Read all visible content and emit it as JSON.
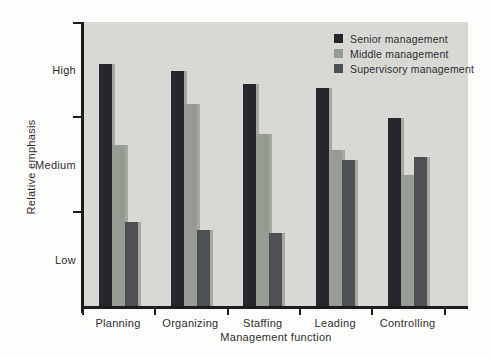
{
  "chart_data": {
    "type": "bar",
    "title": "",
    "xlabel": "Management function",
    "ylabel": "Relative emphasis",
    "categories": [
      "Planning",
      "Organizing",
      "Staffing",
      "Leading",
      "Controlling"
    ],
    "series": [
      {
        "name": "Senior management",
        "color": "#26262c",
        "values": [
          2.56,
          2.48,
          2.35,
          2.31,
          1.99
        ]
      },
      {
        "name": "Middle management",
        "color": "#979c92",
        "values": [
          1.71,
          2.14,
          1.82,
          1.65,
          1.39
        ]
      },
      {
        "name": "Supervisory management",
        "color": "#4e5054",
        "values": [
          0.89,
          0.81,
          0.78,
          1.55,
          1.58
        ]
      }
    ],
    "y_axis": {
      "min": 0,
      "max": 3,
      "tick_values": [
        1,
        2,
        3
      ],
      "band_labels": [
        {
          "label": "High",
          "value": 2.5
        },
        {
          "label": "Medium",
          "value": 1.5
        },
        {
          "label": "Low",
          "value": 0.5
        }
      ]
    },
    "legend_position": "top-right",
    "grid": false,
    "colors": {
      "plot_background": "#d8d8d5",
      "axis": "#1c1c1c",
      "bar_shadow": "#a6a6a3",
      "text": "#2e2e2e",
      "page_background": "#fdfdfb"
    }
  }
}
